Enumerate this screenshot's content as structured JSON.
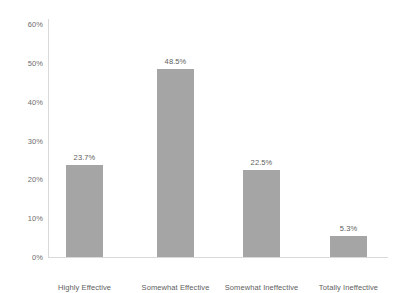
{
  "chart_data": {
    "type": "bar",
    "title": "",
    "subtitle": "",
    "xlabel": "",
    "ylabel": "",
    "categories": [
      "Highly Effective",
      "Somewhat Effective",
      "Somewhat Ineffective",
      "Totally Ineffective"
    ],
    "values": [
      23.7,
      48.5,
      22.5,
      5.3
    ],
    "data_labels": [
      "23.7%",
      "48.5%",
      "22.5%",
      "5.3%"
    ],
    "ylim": [
      0,
      60
    ],
    "ytick_values": [
      60,
      50,
      40,
      30,
      20,
      10,
      0
    ],
    "ytick_labels": [
      "60%",
      "50%",
      "40%",
      "30%",
      "20%",
      "10%",
      "0%"
    ],
    "grid": false,
    "legend": false,
    "legend_position": "none",
    "bar_color": "#a5a5a5",
    "axis_color": "#d9d9d9",
    "text_color": "#5e5e5e",
    "background": "#ffffff"
  }
}
